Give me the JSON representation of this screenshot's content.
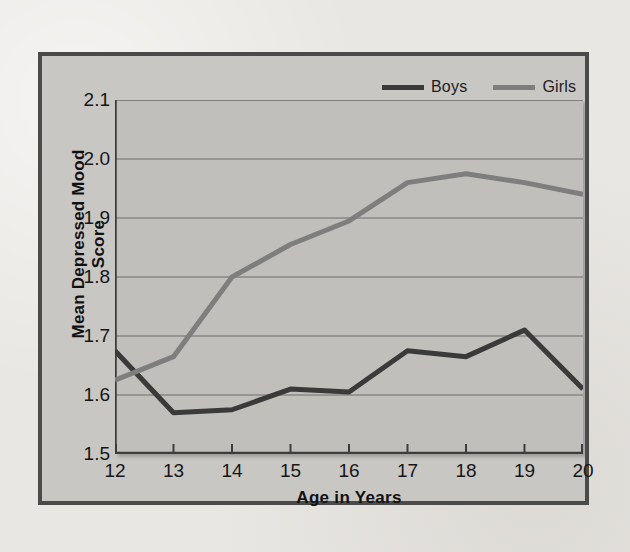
{
  "figure": {
    "panel_bg": "#c9c7c4",
    "panel_border": "#4a4a4a",
    "plot_bg": "#c1bfbc"
  },
  "legend": {
    "position": "top-right",
    "entries": [
      {
        "label": "Boys",
        "color": "#3a3a3a"
      },
      {
        "label": "Girls",
        "color": "#7e7e7e"
      }
    ]
  },
  "axes": {
    "y_title": "Mean Depressed Mood Score",
    "x_title": "Age in Years",
    "y_ticks": [
      "2.1",
      "2.0",
      "1.9",
      "1.8",
      "1.7",
      "1.6",
      "1.5"
    ],
    "x_ticks": [
      "12",
      "13",
      "14",
      "15",
      "16",
      "17",
      "18",
      "19",
      "20"
    ]
  },
  "chart_data": {
    "type": "line",
    "title": "",
    "xlabel": "Age in Years",
    "ylabel": "Mean Depressed Mood Score",
    "x": [
      12,
      13,
      14,
      15,
      16,
      17,
      18,
      19,
      20
    ],
    "categories": [
      "12",
      "13",
      "14",
      "15",
      "16",
      "17",
      "18",
      "19",
      "20"
    ],
    "xlim": [
      12,
      20
    ],
    "ylim": [
      1.5,
      2.1
    ],
    "ytick_values": [
      1.5,
      1.6,
      1.7,
      1.8,
      1.9,
      2.0,
      2.1
    ],
    "grid": "horizontal",
    "legend_position": "top-right",
    "series": [
      {
        "name": "Boys",
        "color": "#3a3a3a",
        "values": [
          1.675,
          1.57,
          1.575,
          1.61,
          1.605,
          1.675,
          1.665,
          1.71,
          1.61
        ]
      },
      {
        "name": "Girls",
        "color": "#7e7e7e",
        "values": [
          1.625,
          1.665,
          1.8,
          1.855,
          1.895,
          1.96,
          1.975,
          1.96,
          1.94
        ]
      }
    ]
  }
}
